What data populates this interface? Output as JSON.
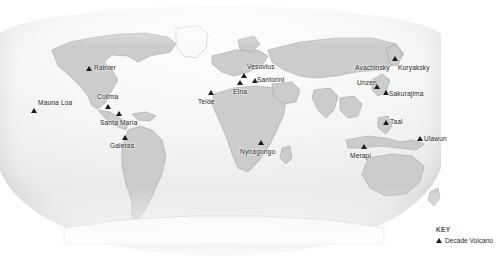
{
  "map": {
    "name": "world-map-decade-volcanoes",
    "projection": "robinson",
    "background_color": "#ffffff",
    "land_color": "#c9cbcb",
    "ocean_color": "#f1f2f2"
  },
  "key": {
    "title": "KEY",
    "symbol": "triangle-marker",
    "label": "Decade Volcano"
  },
  "volcanoes": [
    {
      "name": "Mauna Loa",
      "label_x": 38,
      "label_y": 99,
      "marker_x": 31,
      "marker_y": 108
    },
    {
      "name": "Rainier",
      "label_x": 94,
      "label_y": 64,
      "marker_x": 86,
      "marker_y": 66
    },
    {
      "name": "Colima",
      "label_x": 97,
      "label_y": 93,
      "marker_x": 105,
      "marker_y": 104
    },
    {
      "name": "Santa María",
      "label_x": 100,
      "label_y": 119,
      "marker_x": 116,
      "marker_y": 111
    },
    {
      "name": "Galeras",
      "label_x": 110,
      "label_y": 142,
      "marker_x": 122,
      "marker_y": 135
    },
    {
      "name": "Teide",
      "label_x": 198,
      "label_y": 98,
      "marker_x": 208,
      "marker_y": 90
    },
    {
      "name": "Etna",
      "label_x": 233,
      "label_y": 88,
      "marker_x": 237,
      "marker_y": 80
    },
    {
      "name": "Vesuvius",
      "label_x": 247,
      "label_y": 63,
      "marker_x": 241,
      "marker_y": 73
    },
    {
      "name": "Santorini",
      "label_x": 257,
      "label_y": 76,
      "marker_x": 252,
      "marker_y": 78
    },
    {
      "name": "Nyiragongo",
      "label_x": 240,
      "label_y": 148,
      "marker_x": 258,
      "marker_y": 140
    },
    {
      "name": "Avachinsky",
      "label_x": 355,
      "label_y": 64,
      "marker_x": 392,
      "marker_y": 56
    },
    {
      "name": "Koryaksky",
      "label_x": 398,
      "label_y": 64,
      "marker_x": -1,
      "marker_y": -1
    },
    {
      "name": "Unzen",
      "label_x": 357,
      "label_y": 79,
      "marker_x": 374,
      "marker_y": 84
    },
    {
      "name": "Sakurajima",
      "label_x": 389,
      "label_y": 90,
      "marker_x": 383,
      "marker_y": 90
    },
    {
      "name": "Taal",
      "label_x": 390,
      "label_y": 118,
      "marker_x": 383,
      "marker_y": 120
    },
    {
      "name": "Merapi",
      "label_x": 350,
      "label_y": 152,
      "marker_x": 361,
      "marker_y": 144
    },
    {
      "name": "Ulawun",
      "label_x": 424,
      "label_y": 135,
      "marker_x": 417,
      "marker_y": 136
    }
  ]
}
